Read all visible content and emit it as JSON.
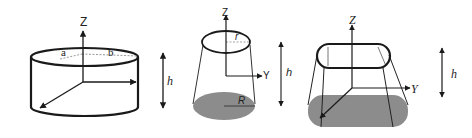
{
  "figures": [
    {
      "name": "elliptic-cylinder",
      "labels": {
        "z": "Z",
        "a": "a",
        "b": "b",
        "h": "h"
      }
    },
    {
      "name": "truncated-cone",
      "labels": {
        "z": "Z",
        "y": "Y",
        "r": "r",
        "R": "R",
        "h": "h"
      }
    },
    {
      "name": "truncated-stadium-prism",
      "labels": {
        "z": "Z",
        "y": "Y",
        "h": "h"
      }
    }
  ],
  "colors": {
    "stroke": "#1a1a1a",
    "shade": "#8c8c8c",
    "dashed": "#9a9a9a",
    "background": "#ffffff"
  }
}
